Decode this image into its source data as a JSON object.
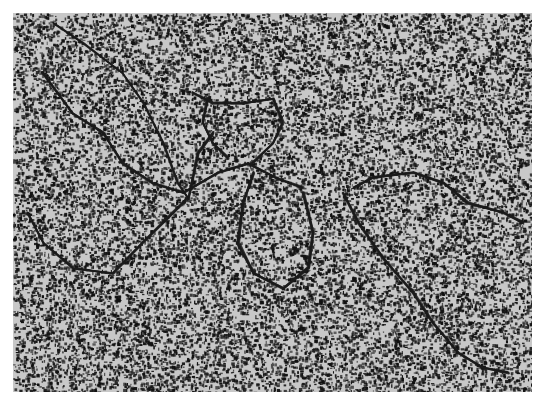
{
  "image": {
    "kind": "electron-micrograph",
    "description": "Grayscale speckled micrograph showing dark thread-like strands (DNA-like filaments) looping across a granular background",
    "colors": {
      "margin": "#ffffff",
      "background": "#c8c8c8",
      "speckle": "#111111",
      "strand": "#1a1a1a"
    },
    "frame": {
      "left": 13,
      "top": 13,
      "width": 519,
      "height": 379
    },
    "strands": [
      [
        [
          40,
          10
        ],
        [
          70,
          30
        ],
        [
          110,
          60
        ],
        [
          130,
          90
        ],
        [
          150,
          130
        ],
        [
          165,
          170
        ],
        [
          175,
          185
        ]
      ],
      [
        [
          30,
          60
        ],
        [
          60,
          100
        ],
        [
          90,
          120
        ],
        [
          110,
          150
        ],
        [
          140,
          170
        ],
        [
          170,
          180
        ],
        [
          205,
          160
        ],
        [
          235,
          150
        ],
        [
          265,
          165
        ],
        [
          290,
          175
        ]
      ],
      [
        [
          180,
          80
        ],
        [
          200,
          90
        ],
        [
          230,
          90
        ],
        [
          260,
          85
        ],
        [
          270,
          110
        ],
        [
          260,
          130
        ],
        [
          240,
          150
        ]
      ],
      [
        [
          195,
          85
        ],
        [
          190,
          110
        ],
        [
          200,
          130
        ],
        [
          215,
          145
        ]
      ],
      [
        [
          15,
          200
        ],
        [
          30,
          230
        ],
        [
          60,
          255
        ],
        [
          100,
          260
        ],
        [
          130,
          230
        ],
        [
          160,
          200
        ],
        [
          175,
          185
        ]
      ],
      [
        [
          240,
          160
        ],
        [
          230,
          190
        ],
        [
          225,
          230
        ],
        [
          240,
          260
        ],
        [
          270,
          275
        ],
        [
          295,
          255
        ],
        [
          300,
          220
        ],
        [
          290,
          180
        ]
      ],
      [
        [
          330,
          180
        ],
        [
          345,
          210
        ],
        [
          370,
          245
        ],
        [
          400,
          280
        ],
        [
          420,
          310
        ],
        [
          445,
          340
        ],
        [
          470,
          355
        ],
        [
          495,
          360
        ]
      ],
      [
        [
          340,
          175
        ],
        [
          360,
          165
        ],
        [
          400,
          160
        ],
        [
          430,
          170
        ],
        [
          455,
          190
        ],
        [
          490,
          200
        ],
        [
          510,
          210
        ]
      ],
      [
        [
          175,
          185
        ],
        [
          185,
          140
        ],
        [
          200,
          120
        ]
      ]
    ]
  }
}
